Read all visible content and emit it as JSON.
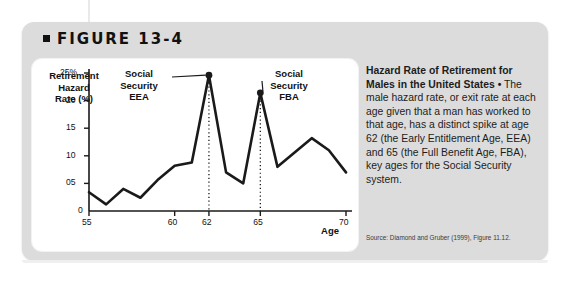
{
  "figure": {
    "label": "FIGURE 13-4",
    "bullet_icon": "square-bullet-icon"
  },
  "caption": {
    "title": "Hazard Rate of Retirement for Males in the United States",
    "separator": "•",
    "body": " The male hazard rate, or exit rate at each age given that a man has worked to that age, has a distinct spike at age 62 (the Early Entitlement Age, EEA) and 65 (the Full Benefit Age, FBA), key ages for the Social Security system.",
    "source": "Source: Diamond and Gruber (1999), Figure 11.12."
  },
  "chart_data": {
    "type": "line",
    "title": "Hazard Rate of Retirement for Males in the United States",
    "xlabel": "Age",
    "ylabel": "Retirement Hazard Rate (%)",
    "xlim": [
      55,
      70
    ],
    "ylim": [
      0,
      25
    ],
    "xticks": [
      55,
      60,
      62,
      65,
      70
    ],
    "xtick_labels": [
      "55",
      "60",
      "62",
      "65",
      "70"
    ],
    "yticks": [
      0,
      5,
      10,
      15,
      20,
      25
    ],
    "ytick_labels": [
      "0",
      "05",
      "10",
      "15",
      "20",
      "25%"
    ],
    "grid": false,
    "legend": "none",
    "x": [
      55,
      56,
      57,
      58,
      59,
      60,
      61,
      62,
      63,
      64,
      65,
      66,
      67,
      68,
      69,
      70
    ],
    "values": [
      3.4,
      1.2,
      4.0,
      2.4,
      5.6,
      8.2,
      8.8,
      24.6,
      7.0,
      5.0,
      21.4,
      8.0,
      10.6,
      13.2,
      11.0,
      7.0
    ],
    "markers": [
      {
        "x": 62,
        "y": 24.6,
        "label": "Social Security EEA"
      },
      {
        "x": 65,
        "y": 21.4,
        "label": "Social Security FBA"
      }
    ],
    "annotations": [
      {
        "name": "eea",
        "line1": "Social",
        "line2": "Security",
        "line3": "EEA",
        "points_to_x": 62
      },
      {
        "name": "fba",
        "line1": "Social",
        "line2": "Security",
        "line3": "FBA",
        "points_to_x": 65
      }
    ],
    "dropline_ages": [
      62,
      65
    ],
    "series_color": "#1a1a1a"
  },
  "colors": {
    "card_background": "#dcdcdc",
    "panel_background": "#ffffff",
    "ink": "#1a1a1a",
    "page_background": "#ffffff"
  }
}
